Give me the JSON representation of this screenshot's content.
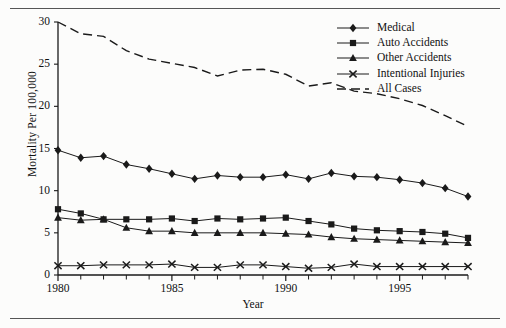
{
  "figure": {
    "background_color": "#fcfcfb",
    "ink_color": "#1a1a1a"
  },
  "chart_data": {
    "type": "line",
    "title": "",
    "xlabel": "Year",
    "ylabel": "Mortality Per 100,000",
    "xlim": [
      1980,
      1998
    ],
    "ylim": [
      0,
      30
    ],
    "xticks": [
      1980,
      1985,
      1990,
      1995
    ],
    "xtick_labels": [
      "1980",
      "1985",
      "1990",
      "1995"
    ],
    "yticks": [
      0,
      5,
      10,
      15,
      20,
      25,
      30
    ],
    "ytick_labels": [
      "0",
      "5",
      "10",
      "15",
      "20",
      "25",
      "30"
    ],
    "minor_xticks_every": 1,
    "grid": false,
    "legend_position": "top-right",
    "x": [
      1980,
      1981,
      1982,
      1983,
      1984,
      1985,
      1986,
      1987,
      1988,
      1989,
      1990,
      1991,
      1992,
      1993,
      1994,
      1995,
      1996,
      1997,
      1998
    ],
    "series": [
      {
        "name": "Medical",
        "marker": "diamond",
        "line_style": "solid",
        "color": "#1a1a1a",
        "values": [
          14.8,
          13.9,
          14.1,
          13.1,
          12.6,
          12.0,
          11.4,
          11.8,
          11.6,
          11.6,
          11.9,
          11.4,
          12.1,
          11.7,
          11.6,
          11.3,
          10.9,
          10.3,
          9.3
        ]
      },
      {
        "name": "Auto Accidents",
        "marker": "square",
        "line_style": "solid",
        "color": "#1a1a1a",
        "values": [
          7.8,
          7.3,
          6.6,
          6.6,
          6.6,
          6.7,
          6.4,
          6.7,
          6.6,
          6.7,
          6.8,
          6.4,
          6.0,
          5.5,
          5.3,
          5.2,
          5.1,
          4.9,
          4.4
        ]
      },
      {
        "name": "Other Accidents",
        "marker": "triangle",
        "line_style": "solid",
        "color": "#1a1a1a",
        "values": [
          6.8,
          6.5,
          6.6,
          5.6,
          5.2,
          5.2,
          5.0,
          5.0,
          5.0,
          5.0,
          4.9,
          4.8,
          4.5,
          4.3,
          4.2,
          4.1,
          4.0,
          3.9,
          3.8
        ]
      },
      {
        "name": "Intentional Injuries",
        "marker": "cross",
        "line_style": "solid",
        "color": "#1a1a1a",
        "values": [
          1.1,
          1.1,
          1.2,
          1.2,
          1.2,
          1.3,
          0.9,
          0.9,
          1.2,
          1.2,
          1.0,
          0.8,
          0.9,
          1.3,
          1.0,
          1.0,
          1.0,
          1.0,
          1.0
        ]
      },
      {
        "name": "All Cases",
        "marker": "none",
        "line_style": "dashed",
        "color": "#1a1a1a",
        "values": [
          30.0,
          28.6,
          28.3,
          26.6,
          25.6,
          25.1,
          24.6,
          23.6,
          24.3,
          24.4,
          23.8,
          22.4,
          22.8,
          21.8,
          21.5,
          20.9,
          20.1,
          18.9,
          17.6
        ]
      }
    ]
  },
  "legend": {
    "items": [
      {
        "label": "Medical",
        "marker": "diamond",
        "line_style": "solid"
      },
      {
        "label": "Auto Accidents",
        "marker": "square",
        "line_style": "solid"
      },
      {
        "label": "Other Accidents",
        "marker": "triangle",
        "line_style": "solid"
      },
      {
        "label": "Intentional Injuries",
        "marker": "cross",
        "line_style": "solid"
      },
      {
        "label": "All Cases",
        "marker": "none",
        "line_style": "dashed"
      }
    ]
  }
}
